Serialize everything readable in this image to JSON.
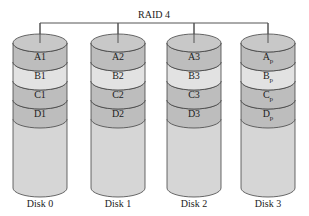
{
  "title": "RAID 4",
  "colors": {
    "band_dark": "#bdbdbd",
    "band_light": "#e2e2e2",
    "body": "#d6d6d6",
    "top": "#c8c8c8",
    "stroke": "#444444"
  },
  "disks": [
    {
      "label": "Disk 0",
      "blocks": [
        {
          "main": "A1",
          "sub": ""
        },
        {
          "main": "B1",
          "sub": ""
        },
        {
          "main": "C1",
          "sub": ""
        },
        {
          "main": "D1",
          "sub": ""
        }
      ]
    },
    {
      "label": "Disk 1",
      "blocks": [
        {
          "main": "A2",
          "sub": ""
        },
        {
          "main": "B2",
          "sub": ""
        },
        {
          "main": "C2",
          "sub": ""
        },
        {
          "main": "D2",
          "sub": ""
        }
      ]
    },
    {
      "label": "Disk 2",
      "blocks": [
        {
          "main": "A3",
          "sub": ""
        },
        {
          "main": "B3",
          "sub": ""
        },
        {
          "main": "C3",
          "sub": ""
        },
        {
          "main": "D3",
          "sub": ""
        }
      ]
    },
    {
      "label": "Disk 3",
      "blocks": [
        {
          "main": "A",
          "sub": "p"
        },
        {
          "main": "B",
          "sub": "p"
        },
        {
          "main": "C",
          "sub": "p"
        },
        {
          "main": "D",
          "sub": "p"
        }
      ]
    }
  ]
}
